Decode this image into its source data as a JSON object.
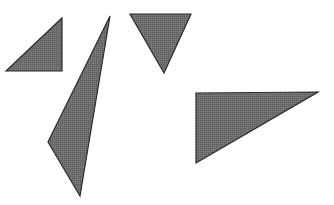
{
  "scene": {
    "title": "Four gray triangles on white background",
    "width": 334,
    "height": 205,
    "background_color": "#ffffff",
    "fill_color": "#6e6e6e",
    "stroke_color": "#2b2b2b",
    "stroke_width": 1.2,
    "fill_texture": "dithered-halftone-gray",
    "shape_count": 4
  },
  "shapes": [
    {
      "id": "triangle-1",
      "name": "small-right-triangle-upper-left",
      "orientation": "right angle at bottom-left, apex upper-right",
      "points": "6,71 62,18 62,71",
      "vertices": [
        [
          6,
          71
        ],
        [
          62,
          18
        ],
        [
          62,
          71
        ]
      ],
      "fill_color": "#6e6e6e",
      "stroke_color": "#2b2b2b"
    },
    {
      "id": "triangle-2",
      "name": "thin-sliver-triangle-center-left",
      "orientation": "narrow vertical sliver, apex at top",
      "points": "110,16 48,142 80,196",
      "vertices": [
        [
          110,
          16
        ],
        [
          48,
          142
        ],
        [
          80,
          196
        ]
      ],
      "fill_color": "#6e6e6e",
      "stroke_color": "#2b2b2b"
    },
    {
      "id": "triangle-3",
      "name": "downward-triangle-top-center",
      "orientation": "point down, flat top edge",
      "points": "130,14 191,14 164,73",
      "vertices": [
        [
          130,
          14
        ],
        [
          191,
          14
        ],
        [
          164,
          73
        ]
      ],
      "fill_color": "#6e6e6e",
      "stroke_color": "#2b2b2b"
    },
    {
      "id": "triangle-4",
      "name": "large-right-triangle-bottom-right",
      "orientation": "right angle at top-left, apex at right",
      "points": "196,93 318,92 196,163",
      "vertices": [
        [
          196,
          93
        ],
        [
          318,
          92
        ],
        [
          196,
          163
        ]
      ],
      "fill_color": "#6e6e6e",
      "stroke_color": "#2b2b2b"
    }
  ]
}
